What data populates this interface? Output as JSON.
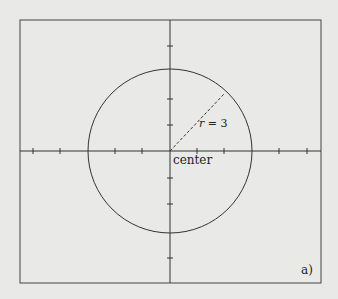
{
  "diagram": {
    "radius_label_var": "r",
    "radius_label_rest": " = 3",
    "center_label": "center",
    "panel_label": "a)",
    "radius": 3,
    "units": {
      "x_min": -5.5,
      "x_max": 5.5
    },
    "colors": {
      "background": "#e9e9e7",
      "ink": "#333333"
    }
  }
}
